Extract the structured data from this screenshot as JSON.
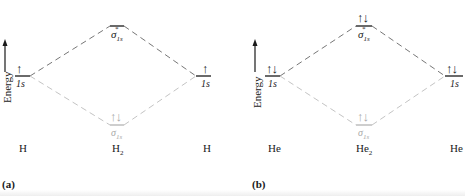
{
  "axis_label": "Energy",
  "colors": {
    "bonding": "#b3b3b3",
    "antibonding": "#777777",
    "dark": "#1a1a1a"
  },
  "panels": [
    {
      "tag": "(a)",
      "left_atom": "H",
      "molecule": "H",
      "molecule_sub": "2",
      "right_atom": "H",
      "left_orbital": "1s",
      "right_orbital": "1s",
      "antibonding_label": "σ",
      "antibonding_sub": "1s",
      "antibonding_sup": "*",
      "bonding_label": "σ",
      "bonding_sub": "1s",
      "left_electrons": "↑",
      "right_electrons": "↑",
      "antibonding_electrons": "",
      "bonding_electrons": "↑↓"
    },
    {
      "tag": "(b)",
      "left_atom": "He",
      "molecule": "He",
      "molecule_sub": "2",
      "right_atom": "He",
      "left_orbital": "1s",
      "right_orbital": "1s",
      "antibonding_label": "σ",
      "antibonding_sub": "1s",
      "antibonding_sup": "*",
      "bonding_label": "σ",
      "bonding_sub": "1s",
      "left_electrons": "↑↓",
      "right_electrons": "↑↓",
      "antibonding_electrons": "↑↓",
      "bonding_electrons": "↑↓"
    }
  ]
}
